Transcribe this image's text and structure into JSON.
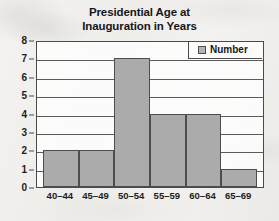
{
  "chart_data": {
    "type": "bar",
    "title": "Presidential Age at Inauguration in Years",
    "title_lines": [
      "Presidential Age at",
      "Inauguration in Years"
    ],
    "categories": [
      "40–44",
      "45–49",
      "50–54",
      "55–59",
      "60–64",
      "65–69"
    ],
    "values": [
      2,
      2,
      7,
      4,
      4,
      1
    ],
    "series": [
      {
        "name": "Number",
        "values": [
          2,
          2,
          7,
          4,
          4,
          1
        ]
      }
    ],
    "xlabel": "",
    "ylabel": "",
    "ylim": [
      0,
      8
    ],
    "ytick_labels": [
      "0",
      "1",
      "2",
      "3",
      "4",
      "5",
      "6",
      "7",
      "8"
    ],
    "ytick_values": [
      0,
      1,
      2,
      3,
      4,
      5,
      6,
      7,
      8
    ],
    "grid": true,
    "grid_axis": "y",
    "legend": {
      "position": "top-right",
      "entries": [
        "Number"
      ]
    },
    "colors": {
      "bar_fill": "#ababab",
      "bar_border": "#4d4d4d",
      "axis": "#4a4a4a",
      "text": "#1d1d20",
      "background": "#f2f1ef",
      "plot_background": "#fcfbfa"
    }
  }
}
